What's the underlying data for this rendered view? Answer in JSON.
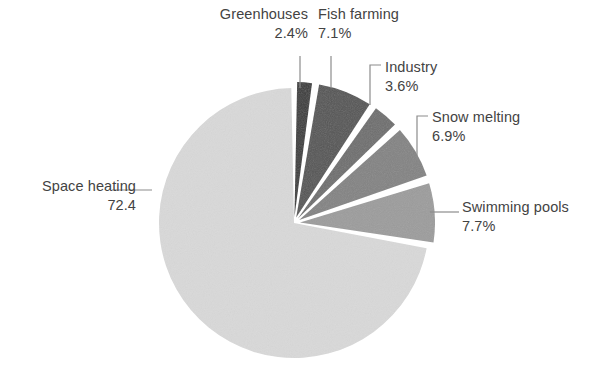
{
  "chart_data": {
    "type": "pie",
    "title": "",
    "subtitle": "",
    "xlabel": "",
    "ylabel": "",
    "legend_position": "none",
    "grid": false,
    "labels_outside": true,
    "start_angle_deg": 0,
    "direction": "clockwise",
    "categories": [
      "Greenhouses",
      "Fish farming",
      "Industry",
      "Snow melting",
      "Swimming pools",
      "Space heating"
    ],
    "values": [
      2.4,
      7.1,
      3.6,
      6.9,
      7.7,
      72.4
    ],
    "value_labels": [
      "2.4%",
      "7.1%",
      "3.6%",
      "6.9%",
      "7.7%",
      "72.4"
    ],
    "colors": [
      "#3a3a3a",
      "#555555",
      "#6e6e6e",
      "#838383",
      "#9c9c9c",
      "#d9d9d9"
    ],
    "slices": [
      {
        "name": "Greenhouses",
        "value": 2.4,
        "value_label": "2.4%",
        "color": "#3a3a3a",
        "exploded": true,
        "leader": "vertical"
      },
      {
        "name": "Fish farming",
        "value": 7.1,
        "value_label": "7.1%",
        "color": "#555555",
        "exploded": true,
        "leader": "vertical"
      },
      {
        "name": "Industry",
        "value": 3.6,
        "value_label": "3.6%",
        "color": "#6e6e6e",
        "exploded": true,
        "leader": "elbow"
      },
      {
        "name": "Snow melting",
        "value": 6.9,
        "value_label": "6.9%",
        "color": "#838383",
        "exploded": true,
        "leader": "elbow"
      },
      {
        "name": "Swimming pools",
        "value": 7.7,
        "value_label": "7.7%",
        "color": "#9c9c9c",
        "exploded": true,
        "leader": "horizontal"
      },
      {
        "name": "Space heating",
        "value": 72.4,
        "value_label": "72.4",
        "color": "#d9d9d9",
        "exploded": false,
        "leader": "horizontal"
      }
    ]
  },
  "labels": {
    "greenhouses": {
      "name": "Greenhouses",
      "value": "2.4%"
    },
    "fish_farming": {
      "name": "Fish farming",
      "value": "7.1%"
    },
    "industry": {
      "name": "Industry",
      "value": "3.6%"
    },
    "snow_melting": {
      "name": "Snow melting",
      "value": "6.9%"
    },
    "swimming_pools": {
      "name": "Swimming pools",
      "value": "7.7%"
    },
    "space_heating": {
      "name": "Space heating",
      "value": "72.4"
    }
  },
  "style": {
    "background": "#ffffff",
    "text_color": "#434343",
    "leader_color": "#8c8c8c",
    "separator_color": "#ffffff"
  }
}
